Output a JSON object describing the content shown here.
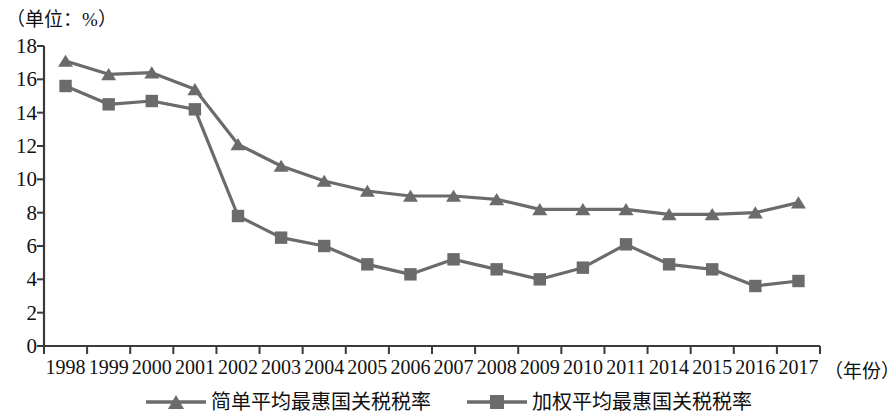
{
  "unit_label": "（单位：%）",
  "x_axis_title": "（年份）",
  "axis": {
    "y_ticks": [
      0,
      2,
      4,
      6,
      8,
      10,
      12,
      14,
      16,
      18
    ],
    "y_min": 0,
    "y_max": 18
  },
  "legend": {
    "items": [
      {
        "label": "简单平均最惠国关税税率",
        "marker": "triangle",
        "color": "#6b6b6b"
      },
      {
        "label": "加权平均最惠国关税税率",
        "marker": "square",
        "color": "#6b6b6b"
      }
    ]
  },
  "chart_data": {
    "type": "line",
    "title": "",
    "xlabel": "（年份）",
    "ylabel": "（单位：%）",
    "ylim": [
      0,
      18
    ],
    "y_ticks": [
      0,
      2,
      4,
      6,
      8,
      10,
      12,
      14,
      16,
      18
    ],
    "grid": false,
    "legend_position": "bottom",
    "categories": [
      "1998",
      "1999",
      "2000",
      "2001",
      "2002",
      "2003",
      "2004",
      "2005",
      "2006",
      "2007",
      "2008",
      "2009",
      "2010",
      "2011",
      "2014",
      "2015",
      "2016",
      "2017"
    ],
    "series": [
      {
        "name": "简单平均最惠国关税税率",
        "marker": "triangle",
        "color": "#6b6b6b",
        "values": [
          17.1,
          16.3,
          16.4,
          15.4,
          12.1,
          10.8,
          9.9,
          9.3,
          9.0,
          9.0,
          8.8,
          8.2,
          8.2,
          8.2,
          7.9,
          7.9,
          8.0,
          8.6
        ]
      },
      {
        "name": "加权平均最惠国关税税率",
        "marker": "square",
        "color": "#6b6b6b",
        "values": [
          15.6,
          14.5,
          14.7,
          14.2,
          7.8,
          6.5,
          6.0,
          4.9,
          4.3,
          5.2,
          4.6,
          4.0,
          4.7,
          6.1,
          4.9,
          4.6,
          3.6,
          3.9
        ]
      }
    ]
  }
}
